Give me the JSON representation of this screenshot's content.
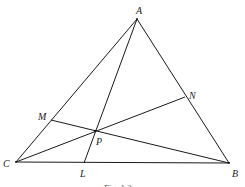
{
  "diagram": {
    "caption": "Fig. 1.2",
    "points": {
      "A": {
        "label": "A",
        "x": 137,
        "y": 19,
        "lx": 136,
        "ly": 14
      },
      "B": {
        "label": "B",
        "x": 229,
        "y": 163,
        "lx": 232,
        "ly": 176
      },
      "C": {
        "label": "C",
        "x": 16,
        "y": 162,
        "lx": 3,
        "ly": 167
      },
      "L": {
        "label": "L",
        "x": 84,
        "y": 163,
        "lx": 80,
        "ly": 177
      },
      "M": {
        "label": "M",
        "x": 51,
        "y": 120,
        "lx": 38,
        "ly": 119
      },
      "N": {
        "label": "N",
        "x": 185,
        "y": 97,
        "lx": 189,
        "ly": 98
      },
      "P": {
        "label": "P",
        "x": 95,
        "y": 131,
        "lx": 96,
        "ly": 144
      }
    },
    "segments": [
      {
        "name": "side-AB",
        "from": "A",
        "to": "B"
      },
      {
        "name": "side-AC",
        "from": "A",
        "to": "C"
      },
      {
        "name": "side-BC",
        "from": "C",
        "to": "B"
      },
      {
        "name": "cevian-AL",
        "from": "A",
        "to": "L"
      },
      {
        "name": "cevian-BM",
        "from": "B",
        "to": "M"
      },
      {
        "name": "cevian-CN",
        "from": "C",
        "to": "N"
      }
    ]
  }
}
